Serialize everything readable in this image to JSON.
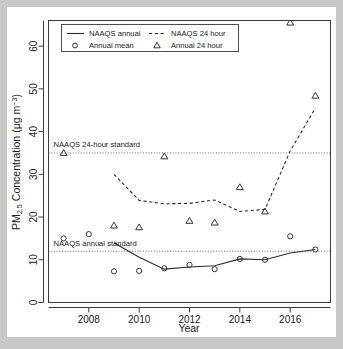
{
  "chart_data": {
    "type": "line",
    "title": "",
    "subtitle": "",
    "xlabel": "Year",
    "ylabel": "PM2.5 Concentration (µg m-3)",
    "ylabel_parts": {
      "prefix": "PM",
      "subscript": "2.5",
      "middle": " Concentration (µg m",
      "superscript": "−3",
      "suffix": ")"
    },
    "xlim": [
      2006.4,
      2017.6
    ],
    "ylim": [
      0,
      66
    ],
    "grid": false,
    "x_tick_labels": [
      "2008",
      "2010",
      "2012",
      "2014",
      "2016"
    ],
    "x_major_ticks": [
      2008,
      2010,
      2012,
      2014,
      2016
    ],
    "x_minor_ticks": [
      2007,
      2009,
      2011,
      2013,
      2015,
      2017
    ],
    "y_tick_labels": [
      "0",
      "10",
      "20",
      "30",
      "40",
      "50",
      "60"
    ],
    "y_ticks": [
      0,
      10,
      20,
      30,
      40,
      50,
      60
    ],
    "legend_position": "top-left-inside",
    "x": [
      2007,
      2008,
      2009,
      2010,
      2011,
      2012,
      2013,
      2014,
      2015,
      2016,
      2017
    ],
    "series": [
      {
        "name": "NAAQS annual",
        "style": "solid-line",
        "x": [
          2009,
          2010,
          2011,
          2012,
          2013,
          2014,
          2015,
          2016,
          2017
        ],
        "values": [
          14.0,
          10.6,
          7.8,
          8.3,
          8.6,
          10.2,
          10.0,
          11.6,
          12.4
        ]
      },
      {
        "name": "NAAQS 24 hour",
        "style": "dashed-line",
        "x": [
          2009,
          2010,
          2011,
          2012,
          2013,
          2014,
          2015,
          2016,
          2017
        ],
        "values": [
          30.0,
          23.9,
          23.1,
          23.2,
          24.0,
          21.3,
          21.8,
          35.5,
          45.5
        ]
      },
      {
        "name": "Annual mean",
        "style": "circle-marker",
        "x": [
          2007,
          2008,
          2009,
          2010,
          2011,
          2012,
          2013,
          2014,
          2015,
          2016,
          2017
        ],
        "values": [
          15.0,
          16.0,
          7.3,
          7.4,
          8.0,
          8.8,
          7.8,
          10.2,
          10.0,
          15.5,
          12.4
        ]
      },
      {
        "name": "Annual 24 hour",
        "style": "triangle-marker",
        "x": [
          2007,
          2009,
          2010,
          2011,
          2012,
          2013,
          2014,
          2015,
          2016,
          2017
        ],
        "values": [
          35.0,
          18.0,
          17.6,
          34.2,
          19.1,
          18.7,
          27.0,
          21.3,
          65.5,
          48.4
        ]
      }
    ],
    "reference_lines": [
      {
        "label": "NAAQS 24-hour standard",
        "value": 35,
        "style": "dotted"
      },
      {
        "label": "NAAQS annual standard",
        "value": 12,
        "style": "dotted"
      }
    ],
    "annotations": [
      {
        "text": "NAAQS 24-hour standard",
        "x": 2006.6,
        "y": 36.4
      },
      {
        "text": "NAAQS annual standard",
        "x": 2006.6,
        "y": 13.3
      }
    ],
    "legend": [
      {
        "label": "NAAQS annual",
        "marker": "solid-line"
      },
      {
        "label": "Annual mean",
        "marker": "circle"
      },
      {
        "label": "NAAQS 24 hour",
        "marker": "dashed-line"
      },
      {
        "label": "Annual 24 hour",
        "marker": "triangle"
      }
    ],
    "colors": {
      "line": "#2b2b2b",
      "reference": "#555555",
      "axis": "#3a3a3a",
      "background": "#ffffff",
      "page_background": "#c8c8c8"
    }
  }
}
